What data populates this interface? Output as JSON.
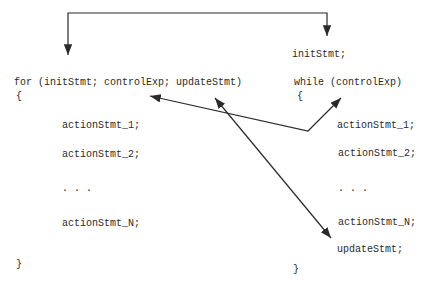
{
  "diagram": {
    "for_block": {
      "header": "for (initStmt; controlExp; updateStmt)",
      "open_brace": "{",
      "statements": [
        "actionStmt_1;",
        "actionStmt_2;",
        ". . .",
        "actionStmt_N;"
      ],
      "close_brace": "}"
    },
    "while_block": {
      "init_statement": "initStmt;",
      "header": "while (controlExp)",
      "open_brace": "{",
      "statements": [
        "actionStmt_1;",
        "actionStmt_2;",
        ". . .",
        "actionStmt_N;",
        "updateStmt;"
      ],
      "close_brace": "}"
    },
    "arrows": [
      {
        "name": "initStmt-mapping",
        "from": "initStmt in for header",
        "to": "initStmt; line above while"
      },
      {
        "name": "controlExp-mapping",
        "from": "controlExp in for header",
        "to": "controlExp in while header"
      },
      {
        "name": "updateStmt-mapping",
        "from": "updateStmt in for header",
        "to": "updateStmt; inside while body"
      }
    ],
    "colors": {
      "background": "#ffffff",
      "text": "#2a2a2a",
      "arrow": "#2a2a2a"
    }
  }
}
